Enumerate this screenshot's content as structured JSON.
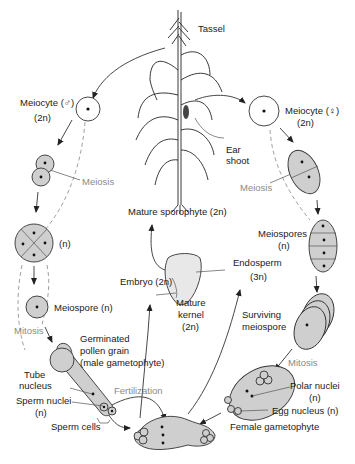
{
  "diagram": {
    "labels": {
      "tassel": "Tassel",
      "meiocyte_male": "Meiocyte (♂)",
      "meiocyte_male_ploidy": "(2n)",
      "meiocyte_female": "Meiocyte (♀)",
      "meiocyte_female_ploidy": "(2n)",
      "ear_shoot_1": "Ear",
      "ear_shoot_2": "shoot",
      "meiosis_left": "Meiosis",
      "meiosis_right": "Meiosis",
      "tetrad_ploidy": "(n)",
      "mature_sporophyte": "Mature sporophyte (2n)",
      "meiospores": "Meiospores",
      "meiospores_ploidy": "(n)",
      "meiospore_male": "Meiospore (n)",
      "endosperm": "Endosperm",
      "endosperm_ploidy": "(3n)",
      "embryo": "Embryo (2n)",
      "mature_kernel_1": "Mature",
      "mature_kernel_2": "kernel",
      "mature_kernel_3": "(2n)",
      "mitosis_left": "Mitosis",
      "pollen_1": "Germinated",
      "pollen_2": "pollen grain",
      "pollen_3": "(male gametophyte)",
      "surviving_1": "Surviving",
      "surviving_2": "meiospore",
      "mitosis_right": "Mitosis",
      "tube_nucleus_1": "Tube",
      "tube_nucleus_2": "nucleus",
      "fertilization": "Fertilization",
      "polar_nuclei": "Polar nuclei",
      "polar_nuclei_ploidy": "(n)",
      "sperm_nuclei": "Sperm nuclei",
      "sperm_nuclei_ploidy": "(n)",
      "egg_nucleus": "Egg nucleus (n)",
      "sperm_cells": "Sperm cells",
      "female_gametophyte": "Female gametophyte"
    },
    "colors": {
      "cell_fill": "#cfcfcf",
      "line": "#333333",
      "process_label": "#8a8a8a"
    }
  }
}
